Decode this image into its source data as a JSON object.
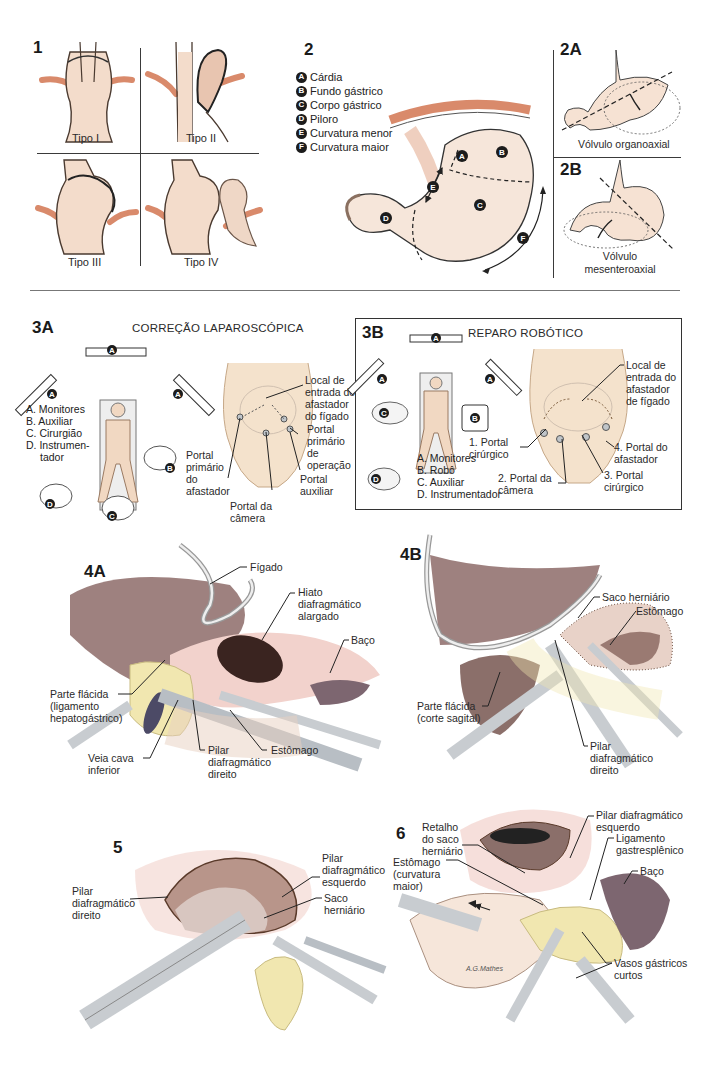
{
  "panel1": {
    "number": "1",
    "types": [
      "Tipo I",
      "Tipo II",
      "Tipo III",
      "Tipo IV"
    ]
  },
  "panel2": {
    "number": "2",
    "legend": [
      {
        "key": "A",
        "label": "Cárdia"
      },
      {
        "key": "B",
        "label": "Fundo gástrico"
      },
      {
        "key": "C",
        "label": "Corpo gástrico"
      },
      {
        "key": "D",
        "label": "Piloro"
      },
      {
        "key": "E",
        "label": "Curvatura menor"
      },
      {
        "key": "F",
        "label": "Curvatura maior"
      }
    ]
  },
  "panel2A": {
    "number": "2A",
    "caption": "Vólvulo organoaxial"
  },
  "panel2B": {
    "number": "2B",
    "caption_line1": "Vólvulo",
    "caption_line2": "mesenteroaxial"
  },
  "panel3A": {
    "number": "3A",
    "title": "CORREÇÃO LAPAROSCÓPICA",
    "legend": [
      "A. Monitores",
      "B. Auxiliar",
      "C. Cirurgião",
      "D. Instrumen-",
      "    tador"
    ],
    "callouts": {
      "liver_retractor": [
        "Local de",
        "entrada do",
        "afastador",
        "do fígado"
      ],
      "primary_operating": [
        "Portal",
        "primário",
        "de",
        "operação"
      ],
      "primary_retractor": [
        "Portal",
        "primário",
        "do",
        "afastador"
      ],
      "auxiliary": [
        "Portal",
        "auxiliar"
      ],
      "camera": [
        "Portal da",
        "câmera"
      ]
    },
    "markers": {
      "monitor": "A",
      "assistant": "B",
      "surgeon": "C",
      "nurse": "D"
    }
  },
  "panel3B": {
    "number": "3B",
    "title": "REPARO ROBÓTICO",
    "legend": [
      "A. Monitores",
      "B. Robô",
      "C. Auxiliar",
      "D. Instrumentador"
    ],
    "callouts": {
      "liver_retractor": [
        "Local de",
        "entrada do",
        "afastador",
        "de fígado"
      ],
      "port1": [
        "1. Portal",
        "cirúrgico"
      ],
      "port2": [
        "2. Portal da",
        "câmera"
      ],
      "port3": [
        "3. Portal",
        "cirúrgico"
      ],
      "port4": [
        "4. Portal do",
        "afastador"
      ]
    },
    "markers": {
      "monitor": "A",
      "robot": "B",
      "assistant": "C",
      "nurse": "D"
    }
  },
  "panel4A": {
    "number": "4A",
    "callouts": {
      "liver": "Fígado",
      "hiatus": [
        "Hiato",
        "diafragmático",
        "alargado"
      ],
      "spleen": "Baço",
      "pars_flaccida": [
        "Parte flácida",
        "(ligamento",
        "hepatogástrico)"
      ],
      "ivc": [
        "Veia cava",
        "inferior"
      ],
      "right_crus": [
        "Pilar",
        "diafragmático",
        "direito"
      ],
      "stomach": "Estômago"
    }
  },
  "panel4B": {
    "number": "4B",
    "callouts": {
      "hernia_sac": "Saco herniário",
      "stomach": "Estômago",
      "pars_flaccida": [
        "Parte flácida",
        "(corte sagital)"
      ],
      "right_crus": [
        "Pilar",
        "diafragmático",
        "direito"
      ]
    }
  },
  "panel5": {
    "number": "5",
    "callouts": {
      "right_crus": [
        "Pilar",
        "diafragmático",
        "direito"
      ],
      "left_crus": [
        "Pilar",
        "diafragmático",
        "esquerdo"
      ],
      "hernia_sac": [
        "Saco",
        "herniário"
      ]
    }
  },
  "panel6": {
    "number": "6",
    "callouts": {
      "sac_flap": [
        "Retalho",
        "do saco",
        "herniário"
      ],
      "stomach": [
        "Estômago",
        "(curvatura",
        "maior)"
      ],
      "left_crus": [
        "Pilar diafragmático",
        "esquerdo"
      ],
      "gastrosplenic": [
        "Ligamento",
        "gastresplênico"
      ],
      "spleen": "Baço",
      "short_gastric": [
        "Vasos gástricos",
        "curtos"
      ]
    },
    "signature": "A.G.Mathes"
  },
  "colors": {
    "tissue": "#f3dccb",
    "tissue_dark": "#c9a58f",
    "muscle": "#d98a6b",
    "liver": "#8d6b68",
    "spleen": "#7d6670",
    "fat": "#f1e7b0",
    "instrument": "#c8ccd0",
    "line": "#2a2a2a"
  }
}
